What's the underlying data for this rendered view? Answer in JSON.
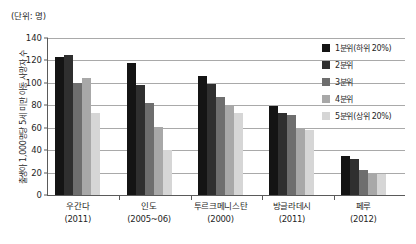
{
  "chart_data": {
    "type": "bar",
    "title": "",
    "unit_label": "(단위: 명)",
    "ylabel": "출생아 1,000명당 5세 미만 아동 사망자 수",
    "xlabel": "",
    "ylim": [
      0,
      140
    ],
    "yticks": [
      0,
      20,
      40,
      60,
      80,
      100,
      120,
      140
    ],
    "ytick_labels": [
      "0",
      "20",
      "40",
      "60",
      "80",
      "100",
      "120",
      "140"
    ],
    "grid": true,
    "legend_position": "right",
    "categories": [
      "우간다",
      "인도",
      "투르크메니스탄",
      "방글라데시",
      "페루"
    ],
    "category_years": [
      "(2011)",
      "(2005~06)",
      "(2000)",
      "(2011)",
      "(2012)"
    ],
    "series": [
      {
        "name": "1분위(하위 20%)",
        "color": "#141414",
        "values": [
          123,
          118,
          106,
          79,
          35
        ]
      },
      {
        "name": "2분위",
        "color": "#2f2f2f",
        "values": [
          125,
          98,
          99,
          73,
          32
        ]
      },
      {
        "name": "3분위",
        "color": "#6e6e6e",
        "values": [
          100,
          82,
          87,
          71,
          22
        ]
      },
      {
        "name": "4분위",
        "color": "#a8a8a8",
        "values": [
          104,
          61,
          80,
          59,
          19
        ]
      },
      {
        "name": "5분위(상위 20%)",
        "color": "#d6d6d6",
        "values": [
          73,
          40,
          73,
          58,
          19
        ]
      }
    ]
  }
}
